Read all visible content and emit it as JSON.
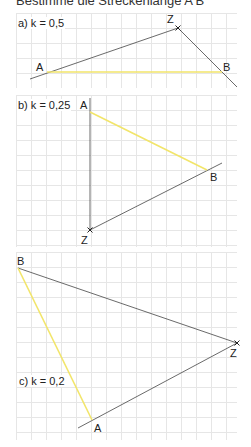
{
  "title": "Bestimme die Streckenlänge A'B'",
  "panels": [
    {
      "id": "a",
      "label": "a)  k = 0,5",
      "points": {
        "Z": "Z",
        "A": "A",
        "B": "B"
      }
    },
    {
      "id": "b",
      "label": "b)  k = 0,25",
      "points": {
        "Z": "Z",
        "A": "A",
        "B": "B"
      }
    },
    {
      "id": "c",
      "label": "c)  k = 0,2",
      "points": {
        "Z": "Z",
        "A": "A",
        "B": "B"
      }
    }
  ],
  "colors": {
    "segment": "#f2e56a",
    "ray": "#444444",
    "grid": "#e6e6e6"
  }
}
